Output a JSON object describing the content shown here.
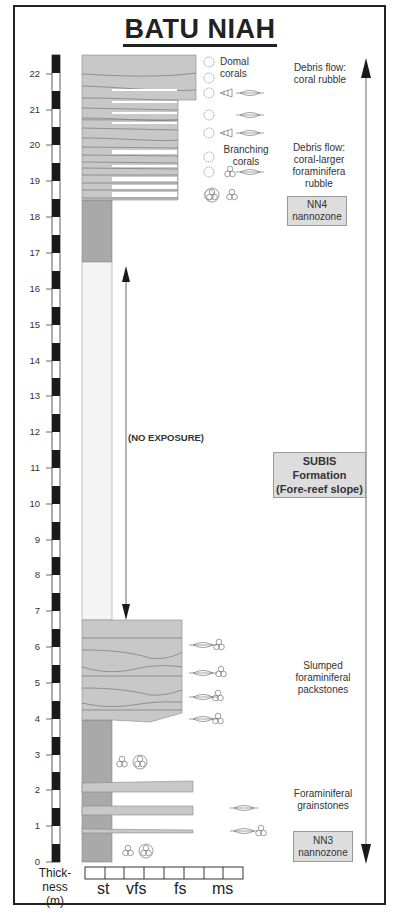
{
  "title": "BATU NIAH",
  "scale": {
    "unit_label_line1": "Thick-",
    "unit_label_line2": "ness",
    "unit_label_line3": "(m)",
    "ticks": [
      "0",
      "1",
      "2",
      "3",
      "4",
      "5",
      "6",
      "7",
      "8",
      "9",
      "10",
      "11",
      "12",
      "13",
      "14",
      "15",
      "16",
      "17",
      "18",
      "19",
      "20",
      "21",
      "22"
    ]
  },
  "grain_size": {
    "labels": [
      "st",
      "vfs",
      "fs",
      "ms"
    ]
  },
  "annotations": {
    "domal_corals": [
      "Domal",
      "corals"
    ],
    "branching_corals": [
      "Branching",
      "corals"
    ],
    "no_exposure": "(NO EXPOSURE)"
  },
  "facies": {
    "debris_coral_rubble": [
      "Debris flow:",
      "coral rubble"
    ],
    "debris_coral_forams": [
      "Debris flow:",
      "coral-larger",
      "foraminifera",
      "rubble"
    ],
    "slumped_packstones": [
      "Slumped",
      "foraminiferal",
      "packstones"
    ],
    "foram_grainstones": [
      "Foraminiferal",
      "grainstones"
    ]
  },
  "zones": {
    "nn4": [
      "NN4",
      "nannozone"
    ],
    "nn3": [
      "NN3",
      "nannozone"
    ],
    "formation": [
      "SUBIS",
      "Formation",
      "(Fore-reef slope)"
    ]
  },
  "colors": {
    "bed_fill": "#c8c8c8",
    "st_fill": "#a9a9a9",
    "no_exposure_fill": "#f4f4f4",
    "zone_box": "#dddddd",
    "scale_black": "#1a1a1a"
  }
}
